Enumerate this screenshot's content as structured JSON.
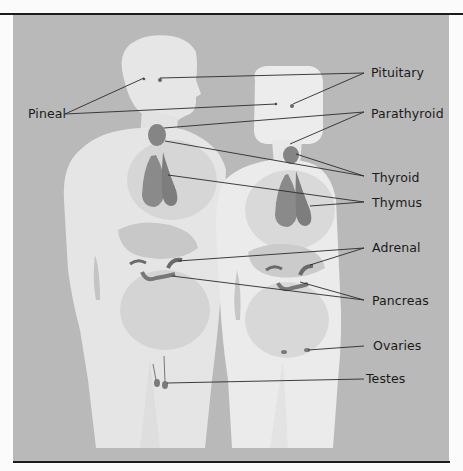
{
  "figure": {
    "colors": {
      "background": "#b9b9b9",
      "body_silhouette": "#e4e4e4",
      "organ_shadow": "#c9c9c9",
      "gland": "#7a7a7a",
      "leader_line": "#2a2a2a",
      "rule": "#1c1c1c"
    },
    "labels": {
      "pituitary": "Pituitary",
      "pineal": "Pineal",
      "parathyroid": "Parathyroid",
      "thyroid": "Thyroid",
      "thymus": "Thymus",
      "adrenal": "Adrenal",
      "pancreas": "Pancreas",
      "ovaries": "Ovaries",
      "testes": "Testes"
    }
  }
}
